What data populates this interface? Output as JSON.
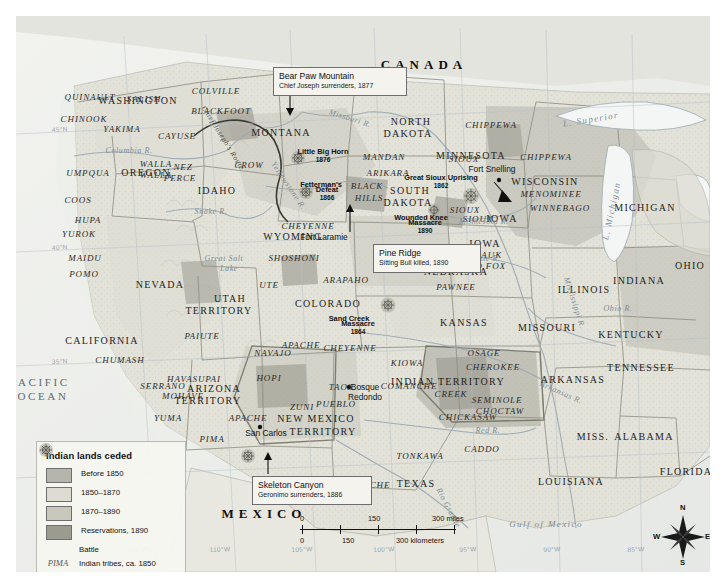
{
  "map": {
    "title": "Indian lands ceded map of the western United States",
    "country_labels": [
      {
        "name": "CANADA",
        "x": 408,
        "y": 49
      },
      {
        "name": "MEXICO",
        "x": 248,
        "y": 498
      }
    ],
    "ocean_labels": [
      {
        "name": "PACIFIC",
        "x": 24,
        "y": 367
      },
      {
        "name": "OCEAN",
        "x": 27,
        "y": 381
      },
      {
        "name": "Gulf of Mexico",
        "x": 530,
        "y": 509
      }
    ],
    "states": [
      {
        "name": "WASHINGTON",
        "x": 122,
        "y": 85,
        "size": "state"
      },
      {
        "name": "OREGON",
        "x": 130,
        "y": 157,
        "size": "state"
      },
      {
        "name": "IDAHO",
        "x": 201,
        "y": 175,
        "size": "state"
      },
      {
        "name": "MONTANA",
        "x": 265,
        "y": 117,
        "size": "state"
      },
      {
        "name": "NORTH",
        "x": 395,
        "y": 106,
        "size": "state"
      },
      {
        "name": "DAKOTA",
        "x": 392,
        "y": 118,
        "size": "state"
      },
      {
        "name": "SOUTH",
        "x": 394,
        "y": 175,
        "size": "state"
      },
      {
        "name": "DAKOTA",
        "x": 392,
        "y": 187,
        "size": "state"
      },
      {
        "name": "MINNESOTA",
        "x": 455,
        "y": 140,
        "size": "state"
      },
      {
        "name": "WISCONSIN",
        "x": 529,
        "y": 166,
        "size": "state"
      },
      {
        "name": "MICHIGAN",
        "x": 629,
        "y": 192,
        "size": "state"
      },
      {
        "name": "IOWA",
        "x": 486,
        "y": 203,
        "size": "state"
      },
      {
        "name": "IOWA",
        "x": 469,
        "y": 228,
        "size": "state"
      },
      {
        "name": "NEBRASKA",
        "x": 440,
        "y": 256,
        "size": "state"
      },
      {
        "name": "WYOMING",
        "x": 277,
        "y": 221,
        "size": "state"
      },
      {
        "name": "NEVADA",
        "x": 144,
        "y": 269,
        "size": "state"
      },
      {
        "name": "CALIFORNIA",
        "x": 86,
        "y": 325,
        "size": "state"
      },
      {
        "name": "UTAH",
        "x": 214,
        "y": 283,
        "size": "state"
      },
      {
        "name": "TERRITORY",
        "x": 203,
        "y": 295,
        "size": "state"
      },
      {
        "name": "COLORADO",
        "x": 312,
        "y": 288,
        "size": "state"
      },
      {
        "name": "KANSAS",
        "x": 448,
        "y": 307,
        "size": "state"
      },
      {
        "name": "MISSOURI",
        "x": 531,
        "y": 312,
        "size": "state"
      },
      {
        "name": "ILLINOIS",
        "x": 568,
        "y": 274,
        "size": "state"
      },
      {
        "name": "INDIANA",
        "x": 623,
        "y": 265,
        "size": "state"
      },
      {
        "name": "OHIO",
        "x": 674,
        "y": 250,
        "size": "state"
      },
      {
        "name": "KENTUCKY",
        "x": 615,
        "y": 319,
        "size": "state"
      },
      {
        "name": "TENNESSEE",
        "x": 625,
        "y": 352,
        "size": "state"
      },
      {
        "name": "ARKANSAS",
        "x": 557,
        "y": 364,
        "size": "state"
      },
      {
        "name": "MISS.",
        "x": 577,
        "y": 421,
        "size": "state"
      },
      {
        "name": "ALABAMA",
        "x": 628,
        "y": 421,
        "size": "state"
      },
      {
        "name": "LOUISIANA",
        "x": 555,
        "y": 466,
        "size": "state"
      },
      {
        "name": "FLORIDA",
        "x": 670,
        "y": 456,
        "size": "state"
      },
      {
        "name": "TEXAS",
        "x": 400,
        "y": 468,
        "size": "state"
      },
      {
        "name": "ARIZONA",
        "x": 198,
        "y": 373,
        "size": "state"
      },
      {
        "name": "TERRITORY",
        "x": 192,
        "y": 385,
        "size": "state"
      },
      {
        "name": "NEW MEXICO",
        "x": 300,
        "y": 403,
        "size": "state"
      },
      {
        "name": "TERRITORY",
        "x": 307,
        "y": 416,
        "size": "state"
      },
      {
        "name": "INDIAN TERRITORY",
        "x": 432,
        "y": 366,
        "size": "state"
      }
    ],
    "tribes": [
      {
        "name": "QUINAULT",
        "x": 74,
        "y": 82
      },
      {
        "name": "SALISH",
        "x": 128,
        "y": 84
      },
      {
        "name": "COLVILLE",
        "x": 200,
        "y": 76
      },
      {
        "name": "CHINOOK",
        "x": 68,
        "y": 104
      },
      {
        "name": "YAKIMA",
        "x": 106,
        "y": 114
      },
      {
        "name": "CAYUSE",
        "x": 161,
        "y": 121
      },
      {
        "name": "BLACKFOOT",
        "x": 205,
        "y": 96
      },
      {
        "name": "CROW",
        "x": 233,
        "y": 150
      },
      {
        "name": "NEZ",
        "x": 167,
        "y": 152
      },
      {
        "name": "PERCE",
        "x": 164,
        "y": 163
      },
      {
        "name": "WALLA",
        "x": 140,
        "y": 149
      },
      {
        "name": "WALLA",
        "x": 140,
        "y": 160
      },
      {
        "name": "UMPQUA",
        "x": 72,
        "y": 158
      },
      {
        "name": "COOS",
        "x": 62,
        "y": 185
      },
      {
        "name": "HUPA",
        "x": 72,
        "y": 205
      },
      {
        "name": "YUROK",
        "x": 63,
        "y": 219
      },
      {
        "name": "MAIDU",
        "x": 69,
        "y": 243
      },
      {
        "name": "POMO",
        "x": 68,
        "y": 259
      },
      {
        "name": "CHUMASH",
        "x": 104,
        "y": 345
      },
      {
        "name": "SERRANO",
        "x": 147,
        "y": 371
      },
      {
        "name": "MOHAVE",
        "x": 167,
        "y": 381
      },
      {
        "name": "HAVASUPAI",
        "x": 178,
        "y": 364
      },
      {
        "name": "YUMA",
        "x": 152,
        "y": 403
      },
      {
        "name": "PIMA",
        "x": 196,
        "y": 424
      },
      {
        "name": "APACHE",
        "x": 232,
        "y": 403
      },
      {
        "name": "APACHE",
        "x": 285,
        "y": 330
      },
      {
        "name": "APACHE",
        "x": 355,
        "y": 470
      },
      {
        "name": "NAVAJO",
        "x": 257,
        "y": 338
      },
      {
        "name": "HOPI",
        "x": 253,
        "y": 363
      },
      {
        "name": "ZUNI",
        "x": 286,
        "y": 392
      },
      {
        "name": "TAOS",
        "x": 325,
        "y": 372
      },
      {
        "name": "PUEBLO",
        "x": 320,
        "y": 389
      },
      {
        "name": "PAIUTE",
        "x": 186,
        "y": 321
      },
      {
        "name": "UTE",
        "x": 253,
        "y": 270
      },
      {
        "name": "SHOSHONI",
        "x": 278,
        "y": 243
      },
      {
        "name": "ARAPAHO",
        "x": 330,
        "y": 265
      },
      {
        "name": "CHEYENNE",
        "x": 292,
        "y": 211
      },
      {
        "name": "CHEYENNE",
        "x": 334,
        "y": 333
      },
      {
        "name": "PAWNEE",
        "x": 440,
        "y": 272
      },
      {
        "name": "KIOWA",
        "x": 391,
        "y": 348
      },
      {
        "name": "COMANCHE",
        "x": 393,
        "y": 371
      },
      {
        "name": "OSAGE",
        "x": 468,
        "y": 338
      },
      {
        "name": "CHEROKEE",
        "x": 477,
        "y": 352
      },
      {
        "name": "CREEK",
        "x": 435,
        "y": 379
      },
      {
        "name": "SEMINOLE",
        "x": 481,
        "y": 385
      },
      {
        "name": "CHOCTAW",
        "x": 484,
        "y": 396
      },
      {
        "name": "CHICKASAW",
        "x": 452,
        "y": 402
      },
      {
        "name": "CADDO",
        "x": 466,
        "y": 434
      },
      {
        "name": "TONKAWA",
        "x": 404,
        "y": 441
      },
      {
        "name": "MANDAN",
        "x": 368,
        "y": 142
      },
      {
        "name": "ARIKARA",
        "x": 372,
        "y": 158
      },
      {
        "name": "BLACK",
        "x": 351,
        "y": 171
      },
      {
        "name": "HILLS",
        "x": 353,
        "y": 183
      },
      {
        "name": "SIOUX",
        "x": 448,
        "y": 144
      },
      {
        "name": "SIOUX",
        "x": 449,
        "y": 195
      },
      {
        "name": "SIOUX",
        "x": 462,
        "y": 204
      },
      {
        "name": "CHIPPEWA",
        "x": 475,
        "y": 110
      },
      {
        "name": "CHIPPEWA",
        "x": 530,
        "y": 142
      },
      {
        "name": "MENOMINEE",
        "x": 535,
        "y": 179
      },
      {
        "name": "WINNEBAGO",
        "x": 544,
        "y": 193
      },
      {
        "name": "SAUK",
        "x": 473,
        "y": 240
      },
      {
        "name": "AND FOX",
        "x": 468,
        "y": 251
      }
    ],
    "water_features": [
      {
        "name": "Columbia R.",
        "x": 113,
        "y": 135
      },
      {
        "name": "Snake R.",
        "x": 195,
        "y": 196
      },
      {
        "name": "Missouri R.",
        "x": 334,
        "y": 103
      },
      {
        "name": "Yellowstone R.",
        "x": 272,
        "y": 170
      },
      {
        "name": "Great Salt",
        "x": 208,
        "y": 243
      },
      {
        "name": "Lake",
        "x": 213,
        "y": 253
      },
      {
        "name": "Platte R.",
        "x": 468,
        "y": 243
      },
      {
        "name": "Minnesota R.",
        "x": 468,
        "y": 206
      },
      {
        "name": "Arkansas R.",
        "x": 545,
        "y": 377
      },
      {
        "name": "Red R.",
        "x": 472,
        "y": 415
      },
      {
        "name": "Rio Grande",
        "x": 432,
        "y": 492
      },
      {
        "name": "Ohio R.",
        "x": 602,
        "y": 293
      },
      {
        "name": "Mississippi R.",
        "x": 558,
        "y": 287
      },
      {
        "name": "L. Superior",
        "x": 575,
        "y": 104
      },
      {
        "name": "L. Michigan",
        "x": 596,
        "y": 195
      },
      {
        "name": "Chief Joseph's Route",
        "x": 207,
        "y": 122
      }
    ],
    "places": [
      {
        "name": "Fort Laramie",
        "x": 308,
        "y": 221
      },
      {
        "name": "Fort Snelling",
        "x": 476,
        "y": 153
      },
      {
        "name": "San Carlos",
        "x": 250,
        "y": 417
      },
      {
        "name": "Bosque",
        "x": 349,
        "y": 371
      },
      {
        "name": "Redondo",
        "x": 349,
        "y": 381
      }
    ],
    "battle_labels": [
      {
        "name": "Little Big Horn",
        "year": "1876",
        "x": 307,
        "y": 140
      },
      {
        "name": "Fetterman's",
        "year": "",
        "x": 305,
        "y": 169
      },
      {
        "name": "Defeat",
        "year": "1866",
        "x": 311,
        "y": 178
      },
      {
        "name": "Great Sioux Uprising",
        "year": "1862",
        "x": 425,
        "y": 166
      },
      {
        "name": "Wounded Knee",
        "year": "",
        "x": 405,
        "y": 202
      },
      {
        "name": "Massacre",
        "year": "1890",
        "x": 409,
        "y": 211
      },
      {
        "name": "Sand Creek",
        "year": "",
        "x": 333,
        "y": 303
      },
      {
        "name": "Massacre",
        "year": "1864",
        "x": 342,
        "y": 312
      }
    ],
    "callouts": [
      {
        "id": "bear-paw-mountain",
        "title": "Bear Paw Mountain",
        "subtitle": "Chief Joseph surrenders, 1877",
        "x": 257,
        "y": 51,
        "w": 122
      },
      {
        "id": "pine-ridge",
        "title": "Pine Ridge",
        "subtitle": "Sitting Bull killed, 1890",
        "x": 357,
        "y": 228,
        "w": 96
      },
      {
        "id": "skeleton-canyon",
        "title": "Skeleton Canyon",
        "subtitle": "Geronimo surrenders, 1886",
        "x": 236,
        "y": 460,
        "w": 108
      }
    ],
    "graticule": {
      "latitudes": [
        "45°N",
        "40°N",
        "35°N"
      ],
      "longitudes": [
        "115°W",
        "110°W",
        "105°W",
        "100°W",
        "95°W",
        "90°W",
        "85°W"
      ]
    }
  },
  "legend": {
    "title": "Indian lands ceded",
    "items": [
      {
        "label": "Before 1850",
        "color": "#b6b5ac",
        "type": "swatch"
      },
      {
        "label": "1850–1870",
        "color": "#dedcd2",
        "type": "swatch"
      },
      {
        "label": "1870–1890",
        "color": "#c9c8bd",
        "type": "swatch"
      },
      {
        "label": "Reservations, 1890",
        "color": "#9c9b90",
        "type": "swatch"
      },
      {
        "label": "Battle",
        "color": "#8e8d82",
        "type": "battle"
      },
      {
        "label": "Indian tribes, ca. 1850",
        "color": "#555555",
        "type": "tribe",
        "sample": "PIMA"
      }
    ]
  },
  "scale": {
    "miles": {
      "ticks": [
        "0",
        "150",
        "300 miles"
      ],
      "unit": "miles"
    },
    "kilometers": {
      "ticks": [
        "0",
        "150",
        "300 kilometers"
      ],
      "unit": "kilometers"
    }
  },
  "compass": {
    "n": "N",
    "e": "E",
    "s": "S",
    "w": "W"
  }
}
